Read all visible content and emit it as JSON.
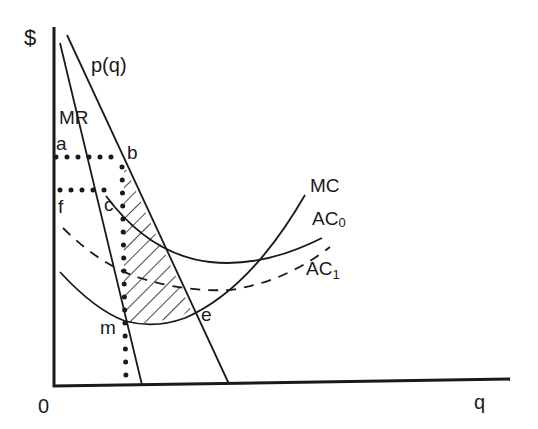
{
  "diagram": {
    "type": "monopoly cost-curve diagram",
    "axes": {
      "y_label": "$",
      "x_label": "q",
      "origin_label": "0"
    },
    "curves": [
      {
        "id": "demand",
        "label": "p(q)",
        "style": "solid"
      },
      {
        "id": "mr",
        "label": "MR",
        "style": "solid"
      },
      {
        "id": "mc",
        "label": "MC",
        "style": "solid"
      },
      {
        "id": "ac0",
        "label": "AC",
        "subscript": "0",
        "style": "solid"
      },
      {
        "id": "ac1",
        "label": "AC",
        "subscript": "1",
        "style": "dashed"
      }
    ],
    "points": {
      "a": "a",
      "b": "b",
      "c": "c",
      "f": "f",
      "m": "m",
      "e": "e"
    },
    "guides": [
      {
        "from": "a",
        "to": "b",
        "style": "dotted"
      },
      {
        "from": "f",
        "to": "c",
        "style": "dotted"
      },
      {
        "from": "b",
        "to": "q-axis",
        "style": "dotted"
      }
    ],
    "shaded_region": "hatched area between p(q) and MC from output at b/m to e",
    "colors": {
      "ink": "#1a1a1a",
      "background": "#ffffff"
    }
  }
}
